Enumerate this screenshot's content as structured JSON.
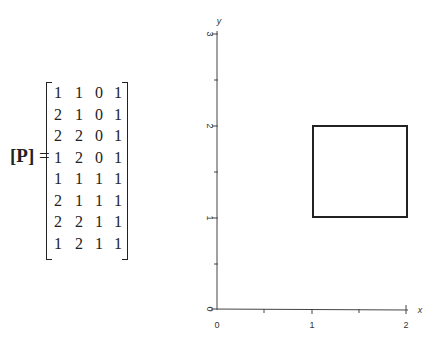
{
  "equation": {
    "lhs_open": "[",
    "lhs_symbol": "P",
    "lhs_close": "]",
    "equals": "=",
    "matrix": [
      [
        "1",
        "1",
        "0",
        "1"
      ],
      [
        "2",
        "1",
        "0",
        "1"
      ],
      [
        "2",
        "2",
        "0",
        "1"
      ],
      [
        "1",
        "2",
        "0",
        "1"
      ],
      [
        "1",
        "1",
        "1",
        "1"
      ],
      [
        "2",
        "1",
        "1",
        "1"
      ],
      [
        "2",
        "2",
        "1",
        "1"
      ],
      [
        "1",
        "2",
        "1",
        "1"
      ]
    ]
  },
  "plot": {
    "x_axis_label": "x",
    "y_axis_label": "y",
    "x_ticks": [
      "0",
      "1",
      "2"
    ],
    "y_ticks": [
      "0",
      "1",
      "2",
      "3"
    ],
    "square": {
      "x_min": 1,
      "x_max": 2,
      "y_min": 1,
      "y_max": 2
    }
  }
}
